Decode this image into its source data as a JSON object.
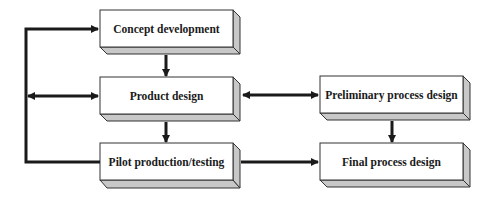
{
  "diagram": {
    "type": "flowchart",
    "style": {
      "line_color": "#1a1a1a",
      "box_face": "#ffffff",
      "box_side": "#c8c8c8",
      "box_border": "#333333"
    },
    "nodes": [
      {
        "id": "concept",
        "label": "Concept development"
      },
      {
        "id": "product",
        "label": "Product design"
      },
      {
        "id": "pilot",
        "label": "Pilot production/testing"
      },
      {
        "id": "prelim",
        "label": "Preliminary process design"
      },
      {
        "id": "final",
        "label": "Final process design"
      }
    ],
    "edges": [
      {
        "from": "concept",
        "to": "product",
        "direction": "forward"
      },
      {
        "from": "product",
        "to": "pilot",
        "direction": "forward"
      },
      {
        "from": "product",
        "to": "prelim",
        "direction": "bidirectional"
      },
      {
        "from": "prelim",
        "to": "final",
        "direction": "forward"
      },
      {
        "from": "pilot",
        "to": "final",
        "direction": "forward"
      },
      {
        "from": "pilot",
        "to": "concept",
        "direction": "feedback-loop"
      },
      {
        "from": "feedback-loop",
        "to": "product",
        "direction": "bidirectional"
      }
    ]
  }
}
